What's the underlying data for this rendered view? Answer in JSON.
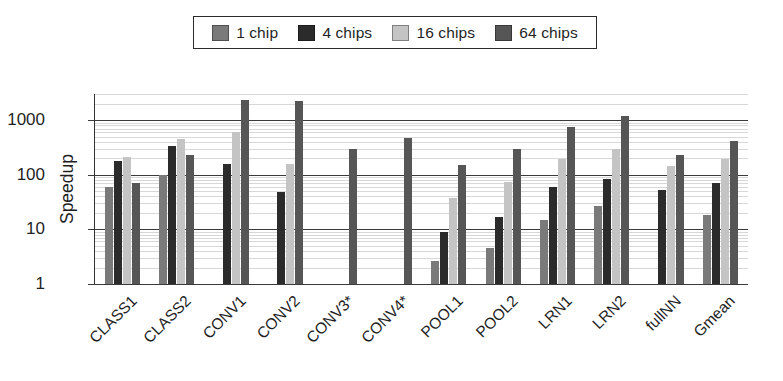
{
  "chart_data": {
    "type": "bar",
    "title": "",
    "xlabel": "",
    "ylabel": "Speedup",
    "yscale": "log",
    "ylim": [
      1,
      3000
    ],
    "ytick_labels": [
      "1",
      "10",
      "100",
      "1000"
    ],
    "ytick_values": [
      1,
      10,
      100,
      1000
    ],
    "grid": "horizontal",
    "legend_position": "top-center",
    "categories": [
      "CLASS1",
      "CLASS2",
      "CONV1",
      "CONV2",
      "CONV3*",
      "CONV4*",
      "POOL1",
      "POOL2",
      "LRN1",
      "LRN2",
      "fullNN",
      "Gmean"
    ],
    "series": [
      {
        "name": "1 chip",
        "color": "#7a7a7a",
        "values": [
          60,
          98,
          null,
          null,
          null,
          null,
          2.6,
          4.5,
          15,
          27,
          null,
          18
        ]
      },
      {
        "name": "4 chips",
        "color": "#2b2b2b",
        "values": [
          175,
          330,
          155,
          48,
          null,
          null,
          9,
          17,
          60,
          82,
          53,
          70
        ]
      },
      {
        "name": "16 chips",
        "color": "#c4c4c4",
        "values": [
          215,
          450,
          600,
          155,
          null,
          null,
          38,
          75,
          190,
          300,
          145,
          190
        ]
      },
      {
        "name": "64 chips",
        "color": "#565656",
        "values": [
          70,
          230,
          2300,
          2250,
          300,
          470,
          150,
          290,
          750,
          1200,
          230,
          420
        ]
      }
    ]
  },
  "legend": {
    "entries": [
      {
        "label": "1 chip"
      },
      {
        "label": "4 chips"
      },
      {
        "label": "16 chips"
      },
      {
        "label": "64 chips"
      }
    ]
  },
  "axes": {
    "y": {
      "title": "Speedup",
      "ticks": [
        {
          "label": "1000"
        },
        {
          "label": "100"
        },
        {
          "label": "10"
        },
        {
          "label": "1"
        }
      ]
    },
    "x": {
      "ticks": [
        {
          "label": "CLASS1"
        },
        {
          "label": "CLASS2"
        },
        {
          "label": "CONV1"
        },
        {
          "label": "CONV2"
        },
        {
          "label": "CONV3*"
        },
        {
          "label": "CONV4*"
        },
        {
          "label": "POOL1"
        },
        {
          "label": "POOL2"
        },
        {
          "label": "LRN1"
        },
        {
          "label": "LRN2"
        },
        {
          "label": "fullNN"
        },
        {
          "label": "Gmean"
        }
      ]
    }
  }
}
